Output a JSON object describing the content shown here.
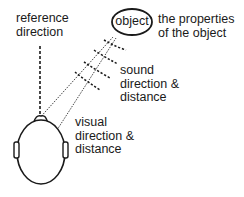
{
  "labels": {
    "reference_direction": "reference\ndirection",
    "object": "object",
    "object_properties": "the properties\nof the object",
    "sound": "sound\ndirection &\ndistance",
    "visual": "visual\ndirection &\ndistance"
  },
  "colors": {
    "ink": "#1a1a1a",
    "background": "#ffffff"
  }
}
